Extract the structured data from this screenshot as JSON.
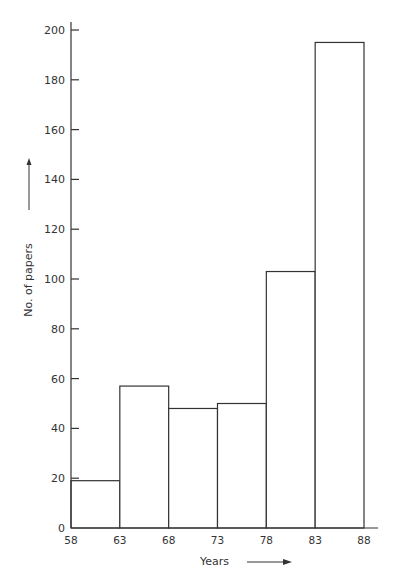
{
  "chart_data": {
    "type": "bar",
    "subtype": "histogram",
    "title": "",
    "xlabel": "Years",
    "ylabel": "No. of papers",
    "bin_edges": [
      58,
      63,
      68,
      73,
      78,
      83,
      88
    ],
    "categories": [
      "58-63",
      "63-68",
      "68-73",
      "73-78",
      "78-83",
      "83-88"
    ],
    "values": [
      19,
      57,
      48,
      50,
      103,
      195
    ],
    "x_ticks": [
      "58",
      "63",
      "68",
      "73",
      "78",
      "83",
      "88"
    ],
    "y_ticks": [
      "0",
      "20",
      "40",
      "60",
      "80",
      "100",
      "120",
      "140",
      "160",
      "180",
      "200"
    ],
    "ylim": [
      0,
      200
    ],
    "xlim": [
      58,
      88
    ],
    "grid": false,
    "legend": null,
    "annotations": [
      "arrow next to y label pointing up",
      "arrow next to x label pointing right"
    ]
  },
  "colors": {
    "line": "#333333",
    "fill": "#ffffff"
  }
}
